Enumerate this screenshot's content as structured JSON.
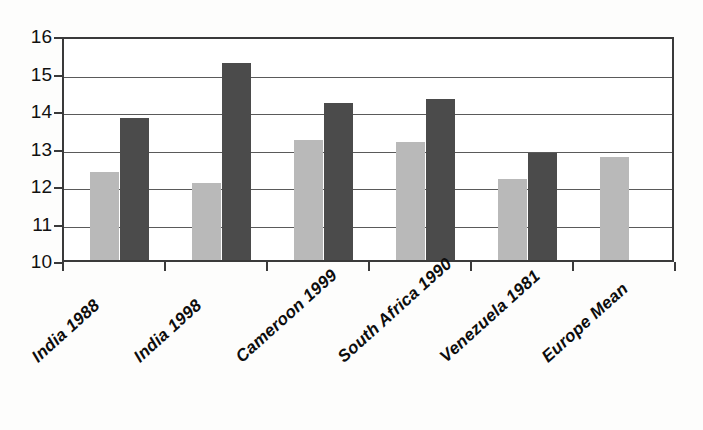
{
  "chart_data": {
    "type": "bar",
    "title": "",
    "subtitle": "",
    "xlabel": "",
    "ylabel": "",
    "categories": [
      "India 1988",
      "India 1998",
      "Cameroon 1999",
      "South Africa 1990",
      "Venezuela 1981",
      "Europe Mean"
    ],
    "series": [
      {
        "name": "Series 1",
        "color": "#b9b9b9",
        "values": [
          12.35,
          12.05,
          13.2,
          13.15,
          12.15,
          12.75
        ]
      },
      {
        "name": "Series 2",
        "color": "#4b4b4b",
        "values": [
          13.8,
          15.25,
          14.2,
          14.3,
          12.85,
          null
        ]
      }
    ],
    "ylim": [
      10,
      16
    ],
    "ytick_labels": [
      "16",
      "15",
      "14",
      "13",
      "12",
      "11",
      "10"
    ],
    "ytick_values": [
      16,
      15,
      14,
      13,
      12,
      11,
      10
    ],
    "grid": true,
    "grid_axis": "y",
    "legend": false,
    "legend_position": "none",
    "annotations": [],
    "axis_color": "#3a3a3a",
    "background": "#ffffff"
  }
}
